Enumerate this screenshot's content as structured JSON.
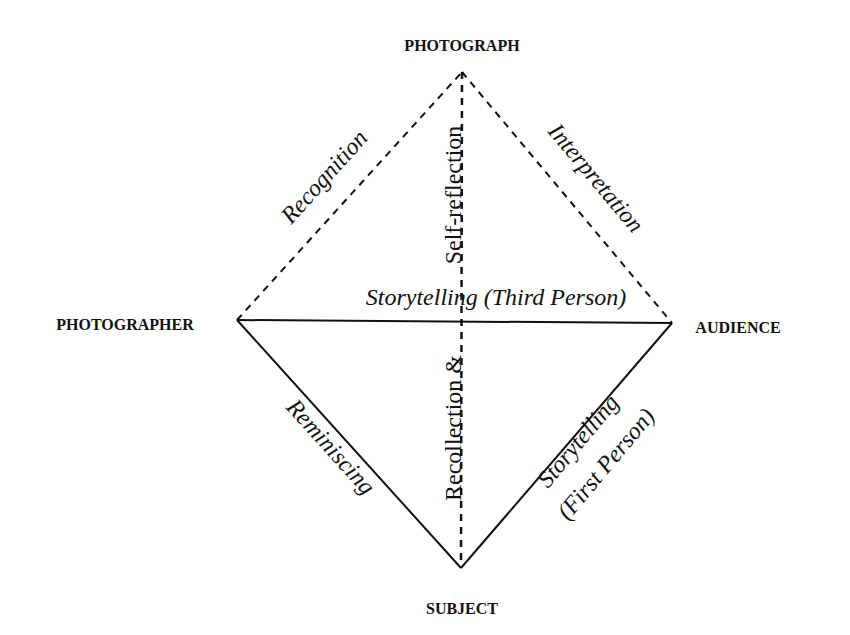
{
  "nodes": {
    "top": "PHOTOGRAPH",
    "left": "PHOTOGRAPHER",
    "right": "AUDIENCE",
    "bottom": "SUBJECT"
  },
  "edges": {
    "photographer_photograph": "Recognition",
    "photograph_audience": "Interpretation",
    "photographer_audience": "Storytelling (Third Person)",
    "photographer_subject": "Reminiscing",
    "subject_audience_line1": "Storytelling",
    "subject_audience_line2": "(First Person)",
    "vertical_upper": "Self-reflection",
    "vertical_lower": "Recollection &"
  },
  "legend": {
    "solid_line": "solid relationship",
    "dashed_line": "dashed relationship"
  }
}
